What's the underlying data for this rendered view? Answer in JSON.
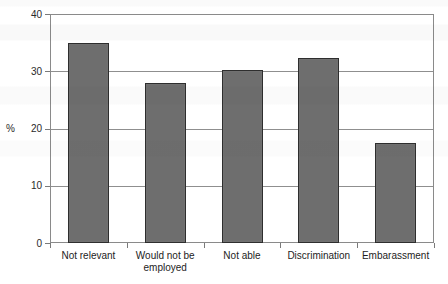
{
  "chart_data": {
    "type": "bar",
    "title": "",
    "xlabel": "",
    "ylabel": "%",
    "categories": [
      "Not relevant",
      "Would not be employed",
      "Not able",
      "Discrimination",
      "Embarassment"
    ],
    "category_lines": [
      [
        "Not relevant"
      ],
      [
        "Would not be",
        "employed"
      ],
      [
        "Not able"
      ],
      [
        "Discrimination"
      ],
      [
        "Embarassment"
      ]
    ],
    "values": [
      35.0,
      28.0,
      30.2,
      32.3,
      17.4
    ],
    "ylim": [
      0,
      40
    ],
    "yticks": [
      0,
      10,
      20,
      30,
      40
    ],
    "ytick_labels": [
      "0",
      "10",
      "20",
      "30",
      "40"
    ],
    "grid": "horizontal",
    "legend": "none",
    "bar_fill_color": "#6e6e6e",
    "bar_edge_color": "#2e2e2e",
    "axis_color": "#8a8a8a",
    "gridline_color": "#8f8f8f",
    "background_color": "#ffffff"
  }
}
